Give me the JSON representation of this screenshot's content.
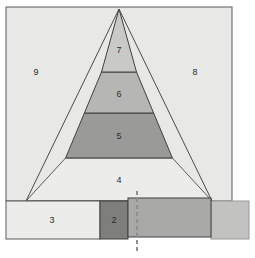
{
  "figure": {
    "canvas": {
      "width": 255,
      "height": 258,
      "background": "#ffffff"
    },
    "colors": {
      "outline": "#5a5a5a",
      "outline_dark": "#3f3f3f",
      "label_text": "#2b2b2b",
      "square_fill": "#e8e8e6",
      "layer7_fill": "#c9c9c7",
      "layer6_fill": "#b6b6b4",
      "layer5_fill": "#9a9a98",
      "layer4_fill": "#ececeb",
      "rect3_fill": "#ececeb",
      "rect2_fill": "#7e7e7c",
      "rect_overlap_fill": "#a9a9a7",
      "rect_tail_fill": "#c2c2c0",
      "dashed_line": "#8f8f8d"
    },
    "geometry": {
      "square": {
        "x": 6,
        "y": 7,
        "width": 226,
        "height": 194
      },
      "triangle": {
        "apex_x": 119,
        "apex_y": 9,
        "base_left_x": 26,
        "base_right_x": 212,
        "base_y": 201
      },
      "layer_boundaries_y": [
        9,
        72,
        113,
        158,
        201
      ],
      "rect3": {
        "x": 6,
        "y": 201,
        "width": 94,
        "height": 38
      },
      "rect2": {
        "x": 100,
        "y": 201,
        "width": 28,
        "height": 38
      },
      "rect_overlap": {
        "x": 128,
        "y": 198,
        "width": 83,
        "height": 39
      },
      "rect_tail": {
        "x": 211,
        "y": 201,
        "width": 38,
        "height": 38
      },
      "dashed_line_x": 137,
      "dashed_line_y1": 191,
      "dashed_line_y2": 251
    }
  },
  "regions": [
    {
      "id": "region-9",
      "label": "9",
      "cx": 36,
      "cy": 73,
      "description": "left outer square region"
    },
    {
      "id": "region-8",
      "label": "8",
      "cx": 195,
      "cy": 73,
      "description": "right outer square region"
    },
    {
      "id": "region-7",
      "label": "7",
      "cx": 119,
      "cy": 51,
      "description": "pyramid top layer"
    },
    {
      "id": "region-6",
      "label": "6",
      "cx": 119,
      "cy": 95,
      "description": "pyramid second layer"
    },
    {
      "id": "region-5",
      "label": "5",
      "cx": 119,
      "cy": 137,
      "description": "pyramid third layer"
    },
    {
      "id": "region-4",
      "label": "4",
      "cx": 119,
      "cy": 181,
      "description": "pyramid bottom layer"
    },
    {
      "id": "region-3",
      "label": "3",
      "cx": 52,
      "cy": 221,
      "description": "bottom left rectangle"
    },
    {
      "id": "region-2",
      "label": "2",
      "cx": 114,
      "cy": 221,
      "description": "bottom dark rectangle"
    }
  ]
}
